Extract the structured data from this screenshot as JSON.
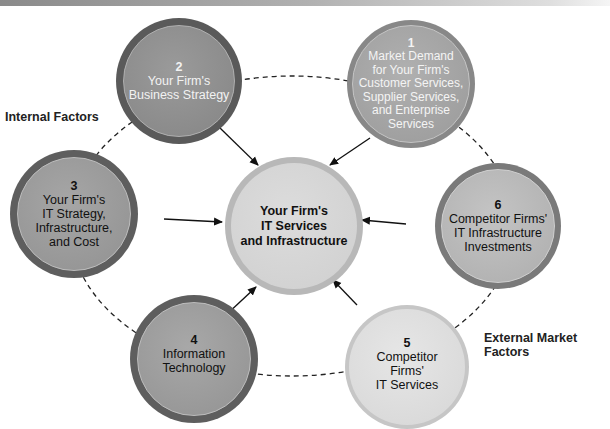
{
  "header": {
    "band": "top-gradient-bar"
  },
  "labels": {
    "internal": "Internal Factors",
    "external": "External Market Factors"
  },
  "center": {
    "line1": "Your Firm's",
    "line2": "IT Services",
    "line3": "and Infrastructure"
  },
  "nodes": [
    {
      "num": "1",
      "lines": [
        "Market Demand",
        "for Your Firm's",
        "Customer Services,",
        "Supplier Services,",
        "and Enterprise",
        "Services"
      ]
    },
    {
      "num": "2",
      "lines": [
        "Your Firm's",
        "Business Strategy"
      ]
    },
    {
      "num": "3",
      "lines": [
        "Your Firm's",
        "IT Strategy,",
        "Infrastructure,",
        "and Cost"
      ]
    },
    {
      "num": "4",
      "lines": [
        "Information",
        "Technology"
      ]
    },
    {
      "num": "5",
      "lines": [
        "Competitor",
        "Firms'",
        "IT Services"
      ]
    },
    {
      "num": "6",
      "lines": [
        "Competitor Firms'",
        "IT Infrastructure",
        "Investments"
      ]
    }
  ],
  "colors": {
    "dark_ring": "#5a5a5a",
    "dark_fill": "#8c8c8c",
    "mid_ring": "#7a7a7a",
    "mid_fill": "#a8a8a8",
    "light_ring": "#b4b4b4",
    "light_fill": "#d4d4d4"
  }
}
